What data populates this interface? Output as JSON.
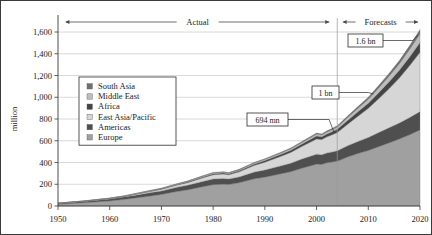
{
  "chart_data": {
    "type": "area",
    "stacked": true,
    "title": "",
    "subtitle": "",
    "xlabel": "",
    "ylabel": "million",
    "xlim": [
      1950,
      2020
    ],
    "ylim": [
      0,
      1600
    ],
    "ytick_labels": [
      "0",
      "200",
      "400",
      "600",
      "800",
      "1,000",
      "1,200",
      "1,400",
      "1,600"
    ],
    "ytick_values": [
      0,
      200,
      400,
      600,
      800,
      1000,
      1200,
      1400,
      1600
    ],
    "xtick_labels": [
      "1950",
      "1960",
      "1970",
      "1980",
      "1990",
      "2000",
      "2010",
      "2020"
    ],
    "xtick_values": [
      1950,
      1960,
      1970,
      1980,
      1990,
      2000,
      2010,
      2020
    ],
    "grid": "horizontal",
    "legend_position": "upper-left-inside",
    "forecast_start": 2004,
    "x": [
      1950,
      1955,
      1960,
      1963,
      1965,
      1968,
      1970,
      1973,
      1975,
      1978,
      1980,
      1982,
      1983,
      1985,
      1988,
      1990,
      1993,
      1995,
      1997,
      2000,
      2001,
      2002,
      2003,
      2004,
      2006,
      2008,
      2010,
      2012,
      2014,
      2016,
      2018,
      2020
    ],
    "series": [
      {
        "name": "Europe",
        "color": "#a0a0a0",
        "values": [
          17,
          30,
          46,
          62,
          74,
          93,
          106,
          133,
          148,
          178,
          196,
          200,
          198,
          213,
          250,
          265,
          295,
          315,
          345,
          385,
          382,
          397,
          404,
          412,
          450,
          482,
          510,
          545,
          580,
          615,
          655,
          700
        ]
      },
      {
        "name": "Americas",
        "color": "#4f4f4f",
        "values": [
          7,
          12,
          18,
          22,
          26,
          30,
          33,
          39,
          42,
          48,
          52,
          52,
          50,
          54,
          62,
          66,
          73,
          78,
          84,
          92,
          89,
          91,
          93,
          95,
          104,
          112,
          120,
          130,
          139,
          148,
          158,
          168
        ]
      },
      {
        "name": "East Asia/Pacific",
        "color": "#d6d6d6",
        "values": [
          1,
          2,
          4,
          6,
          8,
          12,
          15,
          20,
          24,
          33,
          40,
          42,
          40,
          47,
          62,
          72,
          88,
          100,
          115,
          140,
          140,
          148,
          158,
          168,
          198,
          232,
          268,
          312,
          360,
          415,
          478,
          545
        ]
      },
      {
        "name": "Africa",
        "color": "#454545",
        "values": [
          1,
          1,
          2,
          2,
          3,
          4,
          4,
          5,
          6,
          8,
          9,
          9,
          9,
          10,
          13,
          15,
          17,
          19,
          21,
          26,
          26,
          27,
          28,
          30,
          35,
          41,
          47,
          54,
          62,
          70,
          80,
          90
        ]
      },
      {
        "name": "Middle East",
        "color": "#bdbdbd",
        "values": [
          1,
          1,
          2,
          2,
          3,
          4,
          4,
          5,
          6,
          7,
          8,
          8,
          7,
          8,
          10,
          11,
          13,
          14,
          15,
          18,
          17,
          18,
          19,
          21,
          26,
          31,
          37,
          44,
          52,
          60,
          70,
          80
        ]
      },
      {
        "name": "South Asia",
        "color": "#707070",
        "values": [
          0,
          1,
          1,
          1,
          2,
          2,
          2,
          3,
          3,
          4,
          4,
          4,
          4,
          5,
          5,
          6,
          7,
          7,
          8,
          10,
          9,
          10,
          11,
          12,
          14,
          16,
          19,
          22,
          25,
          29,
          34,
          39
        ]
      }
    ],
    "totals_note": [
      {
        "year": 2003,
        "label": "694 mn",
        "value": 694
      },
      {
        "year": 2010,
        "label": "1 bn",
        "value": 1000
      },
      {
        "year": 2020,
        "label": "1.6 bn",
        "value": 1600
      }
    ]
  },
  "legend": {
    "items": [
      {
        "label": "South Asia",
        "color": "#707070"
      },
      {
        "label": "Middle East",
        "color": "#bdbdbd"
      },
      {
        "label": "Africa",
        "color": "#454545"
      },
      {
        "label": "East Asia/Pacific",
        "color": "#d6d6d6"
      },
      {
        "label": "Americas",
        "color": "#4f4f4f"
      },
      {
        "label": "Europe",
        "color": "#a0a0a0"
      }
    ]
  },
  "annotations": {
    "actual_label": "Actual",
    "forecasts_label": "Forecasts",
    "callout_694": "694 mn",
    "callout_1bn": "1 bn",
    "callout_16bn": "1.6 bn"
  },
  "axes": {
    "ylabel": "million",
    "yticks": [
      "1,600",
      "1,400",
      "1,200",
      "1,000",
      "800",
      "600",
      "400",
      "200",
      "0"
    ],
    "xticks": [
      "1950",
      "1960",
      "1970",
      "1980",
      "1990",
      "2000",
      "2010",
      "2020"
    ]
  }
}
